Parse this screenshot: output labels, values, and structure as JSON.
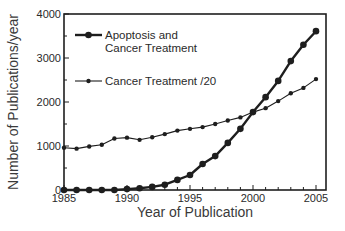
{
  "chart_data": {
    "type": "line",
    "title": "",
    "xlabel": "Year of Publication",
    "ylabel": "Number of Publications/year",
    "xlim": [
      1985,
      2006
    ],
    "ylim": [
      0,
      4000
    ],
    "x_ticks": [
      1985,
      1990,
      1995,
      2000,
      2005
    ],
    "y_ticks": [
      0,
      1000,
      2000,
      3000,
      4000
    ],
    "grid": false,
    "legend_position": "upper left",
    "x": [
      1985,
      1986,
      1987,
      1988,
      1989,
      1990,
      1991,
      1992,
      1993,
      1994,
      1995,
      1996,
      1997,
      1998,
      1999,
      2000,
      2001,
      2002,
      2003,
      2004,
      2005
    ],
    "series": [
      {
        "name": "Apoptosis and Cancer Treatment",
        "legend_lines": [
          "Apoptosis and",
          "Cancer Treatment"
        ],
        "style": "thick line, large markers",
        "values": [
          0,
          0,
          0,
          0,
          0,
          20,
          40,
          70,
          120,
          230,
          340,
          590,
          770,
          1070,
          1390,
          1770,
          2110,
          2480,
          2930,
          3300,
          3610
        ]
      },
      {
        "name": "Cancer Treatment /20",
        "legend_lines": [
          "Cancer Treatment /20"
        ],
        "style": "thin line, small markers",
        "values": [
          960,
          940,
          990,
          1030,
          1170,
          1190,
          1140,
          1200,
          1270,
          1350,
          1390,
          1430,
          1500,
          1580,
          1650,
          1770,
          1860,
          2020,
          2200,
          2320,
          2520
        ]
      }
    ]
  },
  "colors": {
    "line": "#1e1e1e",
    "axis": "#1e1e1e",
    "text": "#2a2a2a"
  }
}
